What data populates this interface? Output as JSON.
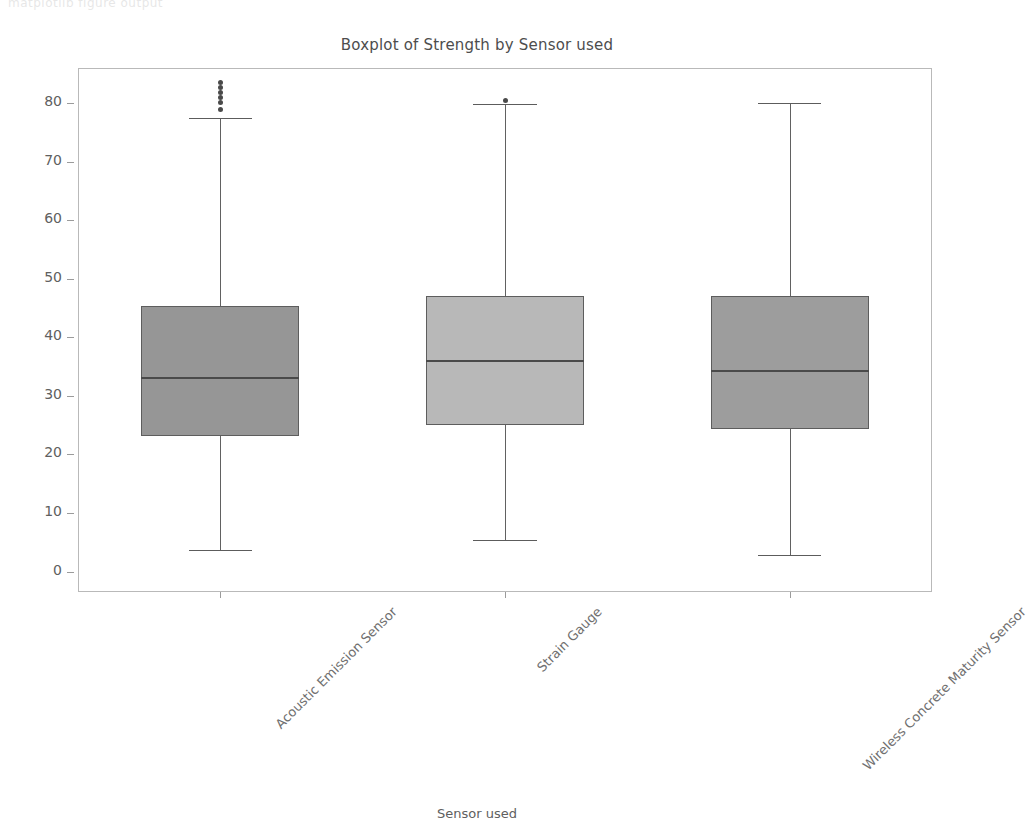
{
  "ghost_header": "matplotlib figure output",
  "chart_data": {
    "type": "box",
    "title": "Boxplot of Strength by Sensor used",
    "xlabel": "Sensor used",
    "ylabel": "Strength",
    "ylim": [
      -3.5,
      86.0
    ],
    "grid": false,
    "legend": "none",
    "ytick_labels": [
      "0",
      "10",
      "20",
      "30",
      "40",
      "50",
      "60",
      "70",
      "80"
    ],
    "ytick_values": [
      0,
      10,
      20,
      30,
      40,
      50,
      60,
      70,
      80
    ],
    "categories": [
      "Acoustic Emission Sensor",
      "Strain Gauge",
      "Wireless Concrete Maturity Sensor"
    ],
    "boxes": [
      {
        "name": "Acoustic Emission Sensor",
        "whisker_low": 3.7,
        "q1": 23.2,
        "median": 33.2,
        "q3": 45.3,
        "whisker_high": 77.5,
        "fill": "#969696",
        "edge": "#5d5d5d",
        "outliers": [
          78.9,
          80.1,
          81.0,
          81.8,
          82.6,
          83.6
        ]
      },
      {
        "name": "Strain Gauge",
        "whisker_low": 5.3,
        "q1": 25.0,
        "median": 36.2,
        "q3": 47.0,
        "whisker_high": 79.8,
        "fill": "#b8b8b8",
        "edge": "#5d5d5d",
        "outliers": [
          80.4
        ]
      },
      {
        "name": "Wireless Concrete Maturity Sensor",
        "whisker_low": 2.9,
        "q1": 24.3,
        "median": 34.4,
        "q3": 47.0,
        "whisker_high": 80.0,
        "fill": "#9d9d9d",
        "edge": "#5d5d5d",
        "outliers": []
      }
    ]
  }
}
